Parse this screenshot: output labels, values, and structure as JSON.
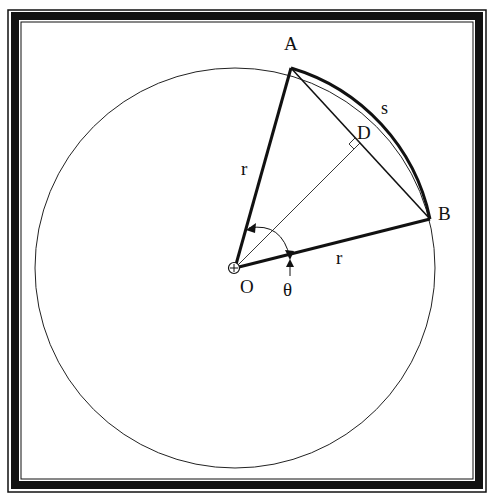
{
  "diagram": {
    "colors": {
      "stroke": "#111111",
      "background": "#ffffff",
      "frame": "#111111"
    },
    "labels": {
      "point_a": "A",
      "point_b": "B",
      "point_d": "D",
      "center": "O",
      "radius_oa": "r",
      "radius_ob": "r",
      "arc": "s",
      "angle": "θ"
    },
    "elements": [
      "circle centered at O",
      "radius OA (bold)",
      "radius OB (bold)",
      "chord AB",
      "arc AB labeled s (bold)",
      "perpendicular bisector OD to chord AB with right-angle mark at D",
      "angle θ between OA and OB with double arrow"
    ]
  }
}
